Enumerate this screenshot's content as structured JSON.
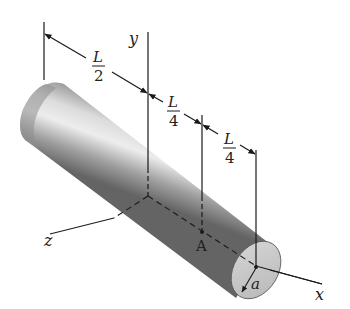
{
  "figure": {
    "colors": {
      "line": "#1a1a1a",
      "shaft_dark": "#6e6e6e",
      "shaft_mid": "#a8a8a8",
      "shaft_light": "#e2e2e2",
      "end_face": "#c9c9c9",
      "background": "#ffffff"
    },
    "axes": {
      "x_label": "x",
      "y_label": "y",
      "z_label": "z"
    },
    "dimensions": [
      {
        "numerator": "L",
        "denominator": "2"
      },
      {
        "numerator": "L",
        "denominator": "4"
      },
      {
        "numerator": "L",
        "denominator": "4"
      }
    ],
    "points": {
      "A_label": "A"
    },
    "radius_label": "a"
  }
}
